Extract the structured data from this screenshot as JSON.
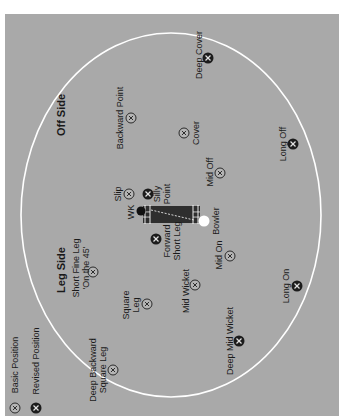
{
  "diagram": {
    "colors": {
      "field": "#a9a9a9",
      "boundary": "#ffffff",
      "pitch": "#2e2e2e",
      "marker_basic_fill": "#b5b5b5",
      "marker_revised_fill": "#1c1c1c"
    },
    "boundary": {
      "cx": 171,
      "cy": 215,
      "rx": 150,
      "ry": 182
    },
    "sides": [
      {
        "label": "Off Side",
        "x": 61,
        "y": 115
      },
      {
        "label": "Leg Side",
        "x": 61,
        "y": 270
      }
    ],
    "legend": [
      {
        "type": "basic",
        "label": "Basic Position",
        "x": 15,
        "y": 408,
        "label_x": 15,
        "label_y": 365
      },
      {
        "type": "revised",
        "label": "Revised Position",
        "x": 36,
        "y": 408,
        "label_x": 36,
        "label_y": 361
      }
    ],
    "pitch": {
      "x": 143,
      "y": 206,
      "width": 57,
      "height": 17
    },
    "players": [
      {
        "label": "WK",
        "x": 141,
        "y": 211,
        "label_x": 131,
        "label_y": 212,
        "color": "#111111"
      },
      {
        "label": "Bowler",
        "x": 204,
        "y": 221,
        "label_x": 216,
        "label_y": 221,
        "color": "#ffffff"
      }
    ],
    "positions": [
      {
        "name": "Deep Cover",
        "lines": [
          "Deep Cover"
        ],
        "type": "revised",
        "x": 208,
        "y": 58,
        "label_x": 199,
        "label_y": 55
      },
      {
        "name": "Backward Point",
        "lines": [
          "Backward Point"
        ],
        "type": "basic",
        "x": 131,
        "y": 118,
        "label_x": 120,
        "label_y": 118
      },
      {
        "name": "Cover",
        "lines": [
          "Cover"
        ],
        "type": "basic",
        "x": 184,
        "y": 133,
        "label_x": 196,
        "label_y": 133
      },
      {
        "name": "Long Off",
        "lines": [
          "Long Off"
        ],
        "type": "revised",
        "x": 293,
        "y": 144,
        "label_x": 283,
        "label_y": 144
      },
      {
        "name": "Slip",
        "lines": [
          "Slip"
        ],
        "type": "basic",
        "x": 129,
        "y": 194,
        "label_x": 118,
        "label_y": 194
      },
      {
        "name": "Silly Point",
        "lines": [
          "Silly",
          "Point"
        ],
        "type": "revised",
        "x": 148,
        "y": 194,
        "label_x": 162,
        "label_y": 194
      },
      {
        "name": "Mid Off",
        "lines": [
          "Mid Off"
        ],
        "type": "basic",
        "x": 220,
        "y": 173,
        "label_x": 210,
        "label_y": 172
      },
      {
        "name": "Forward Short Leg",
        "lines": [
          "Forward",
          "Short Leg"
        ],
        "type": "revised",
        "x": 156,
        "y": 239,
        "label_x": 172,
        "label_y": 241
      },
      {
        "name": "Mid On",
        "lines": [
          "Mid On"
        ],
        "type": "basic",
        "x": 230,
        "y": 256,
        "label_x": 219,
        "label_y": 255
      },
      {
        "name": "Long On",
        "lines": [
          "Long On"
        ],
        "type": "revised",
        "x": 297,
        "y": 286,
        "label_x": 286,
        "label_y": 286
      },
      {
        "name": "Short Fine Leg",
        "lines": [
          "Short Fine Leg",
          "'On the 45'"
        ],
        "type": "basic",
        "x": 93,
        "y": 272,
        "label_x": 81,
        "label_y": 268
      },
      {
        "name": "Square Leg",
        "lines": [
          "Square",
          "Leg"
        ],
        "type": "basic",
        "x": 147,
        "y": 304,
        "label_x": 131,
        "label_y": 305
      },
      {
        "name": "Mid Wicket",
        "lines": [
          "Mid Wicket"
        ],
        "type": "basic",
        "x": 195,
        "y": 285,
        "label_x": 186,
        "label_y": 291
      },
      {
        "name": "Deep Mid Wicket",
        "lines": [
          "Deep Mid Wicket"
        ],
        "type": "revised",
        "x": 239,
        "y": 341,
        "label_x": 230,
        "label_y": 341
      },
      {
        "name": "Deep Backward Square Leg",
        "lines": [
          "Deep Backward",
          "Square Leg"
        ],
        "type": "basic",
        "x": 113,
        "y": 370,
        "label_x": 98,
        "label_y": 370
      }
    ]
  }
}
